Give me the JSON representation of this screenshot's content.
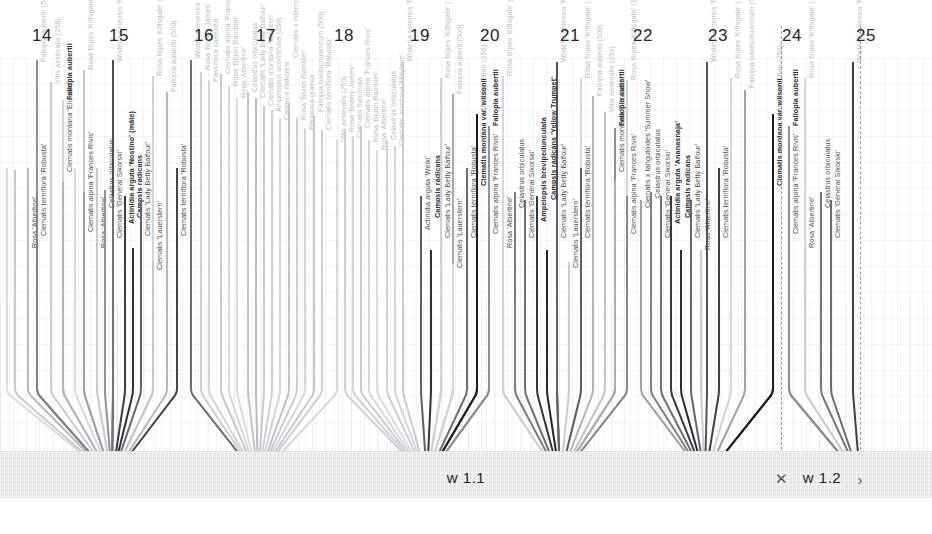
{
  "canvas": {
    "width": 932,
    "height": 534
  },
  "ruler": {
    "name": "top-scale",
    "ticks": [
      {
        "label": "14",
        "x": 42
      },
      {
        "label": "15",
        "x": 119
      },
      {
        "label": "16",
        "x": 204
      },
      {
        "label": "17",
        "x": 266
      },
      {
        "label": "18",
        "x": 344
      },
      {
        "label": "19",
        "x": 420
      },
      {
        "label": "20",
        "x": 490
      },
      {
        "label": "21",
        "x": 570
      },
      {
        "label": "22",
        "x": 643
      },
      {
        "label": "23",
        "x": 718
      },
      {
        "label": "24",
        "x": 792
      },
      {
        "label": "25",
        "x": 866
      }
    ]
  },
  "separators": [
    {
      "name": "section-divider-left",
      "x": 781
    },
    {
      "name": "section-divider-right",
      "x": 860
    }
  ],
  "ground": {
    "bands": [
      {
        "label": "w 1.1",
        "x": 466
      },
      {
        "label": "w 1.2",
        "x": 822
      }
    ],
    "dimension_marks": [
      {
        "glyph": "✕",
        "x": 781
      },
      {
        "glyph": "›",
        "x": 860
      }
    ]
  },
  "bundles": [
    {
      "name": "bundle-1",
      "apex_x": 112,
      "apex_y": 478
    },
    {
      "name": "bundle-2",
      "apex_x": 258,
      "apex_y": 478
    },
    {
      "name": "bundle-3",
      "apex_x": 427,
      "apex_y": 478
    },
    {
      "name": "bundle-4",
      "apex_x": 560,
      "apex_y": 478
    },
    {
      "name": "bundle-5",
      "apex_x": 705,
      "apex_y": 478
    },
    {
      "name": "bundle-6",
      "apex_x": 860,
      "apex_y": 478
    }
  ],
  "stems": [
    {
      "x": 6,
      "top": 168,
      "color": "#d8dade",
      "label": "",
      "label_top": 0,
      "tone": "light"
    },
    {
      "x": 14,
      "top": 170,
      "color": "#c6c9ce",
      "label": "",
      "label_top": 0,
      "tone": "light"
    },
    {
      "x": 27,
      "top": 168,
      "color": "#b7babf",
      "label": "Rosa 'Albertine'",
      "label_top": 248,
      "tone": "mid"
    },
    {
      "x": 36,
      "top": 60,
      "color": "#8d9096",
      "label": "Fallopia aubertii (500)",
      "label_top": 62,
      "tone": "light"
    },
    {
      "x": 36,
      "top": 192,
      "color": "#7f8288",
      "label": "Clematis terniflora 'Robusta'",
      "label_top": 236,
      "tone": "mid"
    },
    {
      "x": 50,
      "top": 82,
      "color": "#c9ccd1",
      "label": "Vitis aestivalis (250)",
      "label_top": 84,
      "tone": "light"
    },
    {
      "x": 62,
      "top": 100,
      "color": "#d2d5da",
      "label": "Fallopia aubertii",
      "label_top": 100,
      "tone": "dark"
    },
    {
      "x": 62,
      "top": 182,
      "color": "#b0b3b8",
      "label": "Clematis montana 'Elizabeth'",
      "label_top": 172,
      "tone": "mid"
    },
    {
      "x": 74,
      "top": 168,
      "color": "#d6d9de",
      "label": "",
      "label_top": 0,
      "tone": "light"
    },
    {
      "x": 83,
      "top": 70,
      "color": "#c2c5ca",
      "label": "Rosa filipes 'Kiftsgate' (100)",
      "label_top": 70,
      "tone": "light"
    },
    {
      "x": 83,
      "top": 192,
      "color": "#9aa0a6",
      "label": "Clematis alpina 'Frances Rivis'",
      "label_top": 232,
      "tone": "mid"
    },
    {
      "x": 96,
      "top": 168,
      "color": "#c7cad0",
      "label": "Rosa 'Albertine'",
      "label_top": 248,
      "tone": "mid"
    },
    {
      "x": 104,
      "top": 190,
      "color": "#8e9197",
      "label": "Celastrus orbiculatus",
      "label_top": 208,
      "tone": "mid"
    },
    {
      "x": 112,
      "top": 60,
      "color": "#4a4d52",
      "label": "Wisteria sinensis 'Prolific' (500)",
      "label_top": 62,
      "tone": "light"
    },
    {
      "x": 112,
      "top": 196,
      "color": "#6f7278",
      "label": "Clematis 'General Sikorski'",
      "label_top": 238,
      "tone": "mid"
    },
    {
      "x": 124,
      "top": 196,
      "color": "#3a3d42",
      "label": "Actinidia arguta 'Nostino' (mâle)",
      "label_top": 224,
      "tone": "dark"
    },
    {
      "x": 132,
      "top": 248,
      "color": "#2b2e33",
      "label": "Campsis radicans",
      "label_top": 218,
      "tone": "dark"
    },
    {
      "x": 140,
      "top": 200,
      "color": "#62656b",
      "label": "Clematis 'Lady Betty Balfour'",
      "label_top": 236,
      "tone": "mid"
    },
    {
      "x": 152,
      "top": 76,
      "color": "#cfd2d7",
      "label": "Rosa filipes 'Kiftsgate' (100)",
      "label_top": 76,
      "tone": "light"
    },
    {
      "x": 152,
      "top": 262,
      "color": "#c3c6cb",
      "label": "Clematis 'Lauerstern'",
      "label_top": 270,
      "tone": "mid"
    },
    {
      "x": 166,
      "top": 92,
      "color": "#b3b6bb",
      "label": "Fallopia aubertii (500)",
      "label_top": 92,
      "tone": "light"
    },
    {
      "x": 176,
      "top": 168,
      "color": "#3f4247",
      "label": "Clematis terniflora 'Robusta'",
      "label_top": 236,
      "tone": "mid"
    },
    {
      "x": 190,
      "top": 60,
      "color": "#6a6d73",
      "label": "Wisteria sinensis 'Prolific' (500)",
      "label_top": 58,
      "tone": "light"
    },
    {
      "x": 200,
      "top": 72,
      "color": "#cbced3",
      "label": "Rosa 'Bobby James'",
      "label_top": 70,
      "tone": "light"
    },
    {
      "x": 208,
      "top": 80,
      "color": "#d0d3d8",
      "label": "Passiflora caerulea",
      "label_top": 82,
      "tone": "light"
    },
    {
      "x": 220,
      "top": 74,
      "color": "#c5c8cd",
      "label": "Clematis alpina 'Frances Rivis'",
      "label_top": 74,
      "tone": "light"
    },
    {
      "x": 228,
      "top": 86,
      "color": "#d4d7dc",
      "label": "Rosa 'Blush Rambler'",
      "label_top": 86,
      "tone": "light"
    },
    {
      "x": 236,
      "top": 98,
      "color": "#d8dbdf",
      "label": "Rosa 'Albertine'",
      "label_top": 98,
      "tone": "light"
    },
    {
      "x": 247,
      "top": 92,
      "color": "#c0c3c8",
      "label": "Celastrus orbiculatus",
      "label_top": 92,
      "tone": "light"
    },
    {
      "x": 255,
      "top": 98,
      "color": "#b8bbc0",
      "label": "Clematis 'Lady Betty Balfour'",
      "label_top": 98,
      "tone": "light"
    },
    {
      "x": 263,
      "top": 106,
      "color": "#c6c9ce",
      "label": "Clematis montana 'Mayleen'",
      "label_top": 106,
      "tone": "light"
    },
    {
      "x": 271,
      "top": 110,
      "color": "#cdd0d5",
      "label": "Ampelopsis aconitifolia (250)",
      "label_top": 112,
      "tone": "light"
    },
    {
      "x": 279,
      "top": 118,
      "color": "#d1d4d9",
      "label": "Campsis radicans",
      "label_top": 120,
      "tone": "light"
    },
    {
      "x": 288,
      "top": 104,
      "color": "#bfc2c7",
      "label": "Clematis x intermedia 'Rubromarginata'",
      "label_top": 58,
      "tone": "light"
    },
    {
      "x": 296,
      "top": 118,
      "color": "#cacdd2",
      "label": "Rosa 'Blush Rambler'",
      "label_top": 120,
      "tone": "light"
    },
    {
      "x": 304,
      "top": 128,
      "color": "#d3d6db",
      "label": "Periploca graeca",
      "label_top": 130,
      "tone": "light"
    },
    {
      "x": 313,
      "top": 116,
      "color": "#c4c7cc",
      "label": "Fallopia baldschuanicum (500)",
      "label_top": 112,
      "tone": "light"
    },
    {
      "x": 321,
      "top": 130,
      "color": "#cbced3",
      "label": "Clematis terniflora 'Robusta'",
      "label_top": 130,
      "tone": "light"
    },
    {
      "x": 336,
      "top": 140,
      "color": "#d5d8dd",
      "label": "Vitis aestivalis (250)",
      "label_top": 142,
      "tone": "light"
    },
    {
      "x": 344,
      "top": 130,
      "color": "#ccd0d5",
      "label": "Rosa 'Bobby James'",
      "label_top": 132,
      "tone": "light"
    },
    {
      "x": 352,
      "top": 136,
      "color": "#d0d3d8",
      "label": "Clematis flammula",
      "label_top": 138,
      "tone": "light"
    },
    {
      "x": 360,
      "top": 126,
      "color": "#c8cbd0",
      "label": "Clematis alpina 'Frances Rivis'",
      "label_top": 128,
      "tone": "light"
    },
    {
      "x": 368,
      "top": 140,
      "color": "#d4d7dc",
      "label": "Rosa 'Blush Rambler'",
      "label_top": 142,
      "tone": "light"
    },
    {
      "x": 376,
      "top": 150,
      "color": "#d9dce1",
      "label": "Rosa 'Albertine'",
      "label_top": 150,
      "tone": "light"
    },
    {
      "x": 386,
      "top": 140,
      "color": "#cdd0d5",
      "label": "Celastrus orbiculatus",
      "label_top": 140,
      "tone": "light"
    },
    {
      "x": 394,
      "top": 146,
      "color": "#d2d5da",
      "label": "Clematis montana 'Mayleen'",
      "label_top": 146,
      "tone": "light"
    },
    {
      "x": 402,
      "top": 62,
      "color": "#c7cacf",
      "label": "Wisteria sinensis 'Prolific' (500)",
      "label_top": 62,
      "tone": "light"
    },
    {
      "x": 420,
      "top": 196,
      "color": "#5c5f65",
      "label": "Actinidia arguta 'Weiki'",
      "label_top": 230,
      "tone": "mid"
    },
    {
      "x": 430,
      "top": 250,
      "color": "#2e3136",
      "label": "Campsis radicans",
      "label_top": 218,
      "tone": "dark"
    },
    {
      "x": 440,
      "top": 78,
      "color": "#cdd0d5",
      "label": "Rosa filipes 'Kiftsgate' (100)",
      "label_top": 78,
      "tone": "light"
    },
    {
      "x": 440,
      "top": 264,
      "color": "#cfd2d7",
      "label": "Clematis 'Lady Betty Balfour'",
      "label_top": 238,
      "tone": "mid"
    },
    {
      "x": 452,
      "top": 94,
      "color": "#a5a8ad",
      "label": "Fallopia aubertii(500)",
      "label_top": 94,
      "tone": "light"
    },
    {
      "x": 452,
      "top": 264,
      "color": "#d3d6db",
      "label": "Clematis 'Lauerstern'",
      "label_top": 268,
      "tone": "mid"
    },
    {
      "x": 466,
      "top": 168,
      "color": "#6a6d73",
      "label": "Clematis terniflora 'Robusta'",
      "label_top": 238,
      "tone": "mid"
    },
    {
      "x": 476,
      "top": 114,
      "color": "#1c1f24",
      "label": "Vitis coignetiae (250)",
      "label_top": 114,
      "tone": "light"
    },
    {
      "x": 476,
      "top": 170,
      "color": "#1c1f24",
      "label": "Clematis montana var. wilsonii",
      "label_top": 186,
      "tone": "dark"
    },
    {
      "x": 488,
      "top": 126,
      "color": "#909398",
      "label": "Fallopia aubertii",
      "label_top": 126,
      "tone": "dark"
    },
    {
      "x": 488,
      "top": 196,
      "color": "#8b8e94",
      "label": "Clematis alpina 'Frances Rivis'",
      "label_top": 234,
      "tone": "mid"
    },
    {
      "x": 502,
      "top": 76,
      "color": "#d3d6db",
      "label": "Rosa filipes 'Kiftsgate' (100)",
      "label_top": 76,
      "tone": "light"
    },
    {
      "x": 502,
      "top": 248,
      "color": "#cdd0d5",
      "label": "Rosa 'Albertine'",
      "label_top": 248,
      "tone": "mid"
    },
    {
      "x": 514,
      "top": 192,
      "color": "#7a7d83",
      "label": "Celastrus orbiculatus",
      "label_top": 208,
      "tone": "mid"
    },
    {
      "x": 524,
      "top": 200,
      "color": "#6e7177",
      "label": "Clematis 'General Sikorski'",
      "label_top": 238,
      "tone": "mid"
    },
    {
      "x": 536,
      "top": 196,
      "color": "#333639",
      "label": "Ampelopsis brevipedunculata",
      "label_top": 222,
      "tone": "dark"
    },
    {
      "x": 546,
      "top": 250,
      "color": "#232629",
      "label": "Campsis radicans 'Yellow Trumpet'",
      "label_top": 200,
      "tone": "dark"
    },
    {
      "x": 556,
      "top": 62,
      "color": "#4c4f55",
      "label": "Wisteria sinensis 'Prolific' (500)",
      "label_top": 62,
      "tone": "light"
    },
    {
      "x": 556,
      "top": 200,
      "color": "#5f6268",
      "label": "Clematis 'Lady Betty Balfour'",
      "label_top": 238,
      "tone": "mid"
    },
    {
      "x": 568,
      "top": 262,
      "color": "#c9ccd1",
      "label": "Clematis 'Lauerstern'",
      "label_top": 268,
      "tone": "mid"
    },
    {
      "x": 580,
      "top": 78,
      "color": "#d2d5da",
      "label": "Rosa filipes 'Kiftsgate' (100)",
      "label_top": 78,
      "tone": "light"
    },
    {
      "x": 580,
      "top": 168,
      "color": "#5a5d63",
      "label": "Clematis terniflora 'Robusta'",
      "label_top": 238,
      "tone": "mid"
    },
    {
      "x": 592,
      "top": 96,
      "color": "#b0b3b8",
      "label": "Fallopia aubertii (500)",
      "label_top": 96,
      "tone": "light"
    },
    {
      "x": 604,
      "top": 112,
      "color": "#c0c3c8",
      "label": "Vitis aestivalis (250)",
      "label_top": 112,
      "tone": "light"
    },
    {
      "x": 614,
      "top": 128,
      "color": "#8a8d93",
      "label": "Fallopia aubertii",
      "label_top": 126,
      "tone": "dark"
    },
    {
      "x": 614,
      "top": 180,
      "color": "#a9acb1",
      "label": "Clematis montana 'Elizabeth'",
      "label_top": 172,
      "tone": "mid"
    },
    {
      "x": 626,
      "top": 80,
      "color": "#cfd2d7",
      "label": "Rosa filipes 'Kiftsgate' (100)",
      "label_top": 80,
      "tone": "light"
    },
    {
      "x": 626,
      "top": 196,
      "color": "#83868c",
      "label": "Clematis alpina 'Frances Rivis'",
      "label_top": 234,
      "tone": "mid"
    },
    {
      "x": 640,
      "top": 200,
      "color": "#9b9ea3",
      "label": "Clematis x tangutoides 'Summer Snow'",
      "label_top": 208,
      "tone": "mid"
    },
    {
      "x": 650,
      "top": 192,
      "color": "#7d8086",
      "label": "Celastrus orbiculatus",
      "label_top": 198,
      "tone": "mid"
    },
    {
      "x": 660,
      "top": 196,
      "color": "#6d7076",
      "label": "Clematis 'General Sikorski'",
      "label_top": 238,
      "tone": "mid"
    },
    {
      "x": 670,
      "top": 196,
      "color": "#36393e",
      "label": "Actinidia arguta 'Ananasnaja'",
      "label_top": 224,
      "tone": "dark"
    },
    {
      "x": 680,
      "top": 250,
      "color": "#282b30",
      "label": "Campsis radicans",
      "label_top": 218,
      "tone": "dark"
    },
    {
      "x": 690,
      "top": 200,
      "color": "#64676d",
      "label": "Clematis 'Lady Betty Balfour'",
      "label_top": 238,
      "tone": "mid"
    },
    {
      "x": 700,
      "top": 250,
      "color": "#cbced3",
      "label": "Rosa 'Albertine'",
      "label_top": 250,
      "tone": "mid"
    },
    {
      "x": 706,
      "top": 62,
      "color": "#4f5258",
      "label": "Wisteria sinensis 'Prolific' (500)",
      "label_top": 62,
      "tone": "light"
    },
    {
      "x": 718,
      "top": 168,
      "color": "#3c3f44",
      "label": "Clematis terniflora 'Robusta'",
      "label_top": 238,
      "tone": "mid"
    },
    {
      "x": 730,
      "top": 78,
      "color": "#d0d3d8",
      "label": "Rosa filipes 'Kiftsgate' (100)",
      "label_top": 78,
      "tone": "light"
    },
    {
      "x": 744,
      "top": 90,
      "color": "#9fa2a7",
      "label": "Fallopia baldschuanicum (500)",
      "label_top": 88,
      "tone": "light"
    },
    {
      "x": 772,
      "top": 114,
      "color": "#1a1d22",
      "label": "Vitis coignetiae (250)",
      "label_top": 114,
      "tone": "light"
    },
    {
      "x": 772,
      "top": 170,
      "color": "#1a1d22",
      "label": "Clematis montana var. wilsonii",
      "label_top": 186,
      "tone": "dark"
    },
    {
      "x": 788,
      "top": 126,
      "color": "#8d9096",
      "label": "Fallopia aubertii",
      "label_top": 126,
      "tone": "dark"
    },
    {
      "x": 788,
      "top": 196,
      "color": "#8a8d93",
      "label": "Clematis alpina 'Frances Rivis'",
      "label_top": 234,
      "tone": "mid"
    },
    {
      "x": 804,
      "top": 78,
      "color": "#d3d6db",
      "label": "Rosa filipes 'Kiftsgate' (100)",
      "label_top": 78,
      "tone": "light"
    },
    {
      "x": 804,
      "top": 248,
      "color": "#cbced3",
      "label": "Rosa 'Albertine'",
      "label_top": 248,
      "tone": "mid"
    },
    {
      "x": 820,
      "top": 192,
      "color": "#76797f",
      "label": "Celastrus orbiculatus",
      "label_top": 208,
      "tone": "mid"
    },
    {
      "x": 830,
      "top": 200,
      "color": "#6a6d73",
      "label": "Clematis 'General Sikorski'",
      "label_top": 238,
      "tone": "mid"
    },
    {
      "x": 852,
      "top": 62,
      "color": "#3d4045",
      "label": "Wisteria sinensis 'Prolific' (500)",
      "label_top": 62,
      "tone": "light"
    }
  ]
}
